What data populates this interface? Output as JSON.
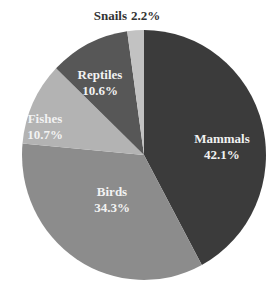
{
  "chart_data": {
    "type": "pie",
    "title": "",
    "start_angle_deg": -90,
    "direction": "clockwise",
    "center": [
      144,
      155
    ],
    "radius": [
      122,
      125
    ],
    "slices": [
      {
        "name": "Mammals",
        "value": 42.1,
        "label": "Mammals",
        "pct_label": "42.1%",
        "color": "#3b3b3b",
        "label_pos": [
          222,
          147
        ],
        "label_style": "stacked"
      },
      {
        "name": "Birds",
        "value": 34.3,
        "label": "Birds",
        "pct_label": "34.3%",
        "color": "#8c8c8c",
        "label_pos": [
          112,
          200
        ],
        "label_style": "stacked"
      },
      {
        "name": "Fishes",
        "value": 10.7,
        "label": "Fishes",
        "pct_label": "10.7%",
        "color": "#b3b3b3",
        "label_pos": [
          45,
          127
        ],
        "label_style": "stacked"
      },
      {
        "name": "Reptiles",
        "value": 10.6,
        "label": "Reptiles",
        "pct_label": "10.6%",
        "color": "#575757",
        "label_pos": [
          100,
          83
        ],
        "label_style": "stacked"
      },
      {
        "name": "Snails",
        "value": 2.2,
        "label": "Snails",
        "pct_label": "2.2%",
        "color": "#c2c2c2",
        "label_pos": [
          127,
          16
        ],
        "label_style": "outside-inline"
      }
    ],
    "legend": null
  }
}
